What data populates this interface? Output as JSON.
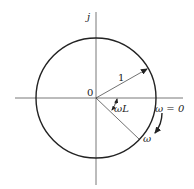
{
  "diagram": {
    "type": "complex-plane-locus",
    "axes": {
      "imaginary_label": "j",
      "origin_label": "0"
    },
    "circle": {
      "radius_label": "1"
    },
    "angle_label": "ωL",
    "points": {
      "start_label": "ω = 0",
      "moving_label": "ω"
    },
    "colors": {
      "stroke": "#222222",
      "axis": "#555555",
      "background": "#ffffff"
    }
  }
}
